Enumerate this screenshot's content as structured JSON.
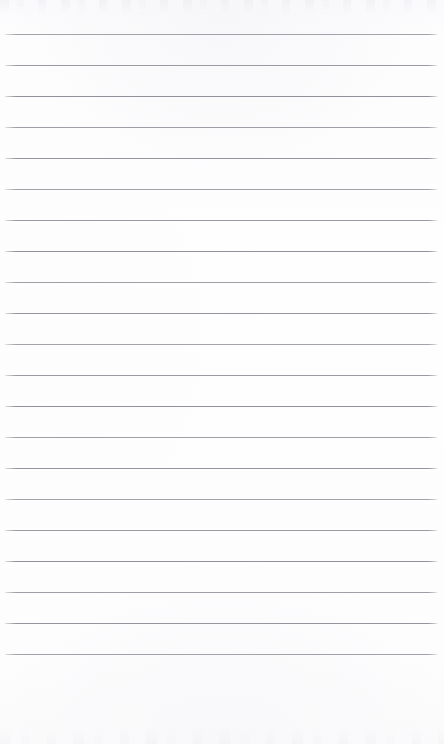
{
  "document": {
    "kind": "lined-notebook-page",
    "title": "Blank Ruled Paper",
    "has_text_content": false,
    "written_content": "",
    "page_width": 444,
    "page_height": 744
  },
  "paper": {
    "background_color": "#fdfdfe",
    "edge_tint_color": "#fafafc",
    "top_noise_height": 14,
    "bottom_noise_height": 16,
    "bottom_margin_height": 90
  },
  "ruling": {
    "line_color": "#8d8d96",
    "line_bleed_color": "#aaaab4",
    "line_thickness": 1,
    "line_count": 21,
    "first_line_y": 34,
    "line_spacing": 31,
    "line_start_x": 4,
    "line_end_x": 438,
    "line_width": 434,
    "lines_y": [
      34,
      65,
      96,
      127,
      158,
      189,
      220,
      251,
      282,
      313,
      344,
      375,
      406,
      437,
      468,
      499,
      530,
      561,
      592,
      623,
      654
    ]
  }
}
